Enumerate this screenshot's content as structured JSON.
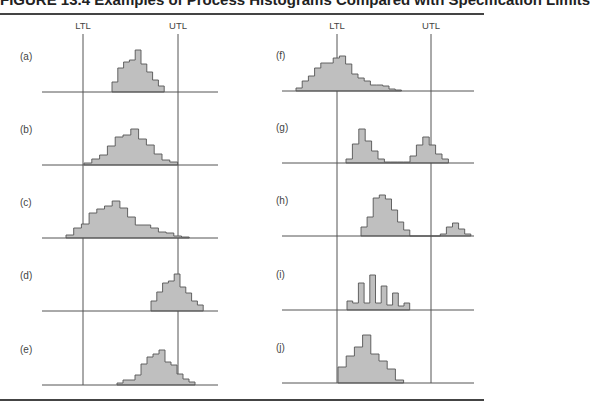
{
  "figure": {
    "title": "FIGURE 13.4 Examples of Process Histograms Compared with Specification Limits",
    "limits": {
      "lower": "LTL",
      "upper": "UTL"
    },
    "colors": {
      "fill": "#bfbfbf",
      "stroke": "#555555",
      "line": "#555555"
    }
  },
  "chart_data": {
    "type": "histogram-panels",
    "title": "FIGURE 13.4",
    "columns": [
      {
        "ltl_x": 83,
        "utl_x": 178,
        "panels": [
          {
            "label": "(a)",
            "baseline": 92,
            "x0": 112,
            "bw": 5.8,
            "heights": [
              10,
              24,
              30,
              32,
              42,
              28,
              20,
              12,
              6
            ],
            "description": "narrow, centered, well within limits"
          },
          {
            "label": "(b)",
            "baseline": 165,
            "x0": 84,
            "bw": 7.8,
            "heights": [
              2,
              6,
              10,
              19,
              28,
              30,
              36,
              26,
              20,
              11,
              5,
              3
            ],
            "description": "spread fills the tolerance exactly"
          },
          {
            "label": "(c)",
            "baseline": 238,
            "x0": 66,
            "bw": 7.7,
            "heights": [
              3,
              10,
              14,
              25,
              29,
              32,
              37,
              30,
              21,
              13,
              13,
              10,
              6,
              5,
              2,
              1
            ],
            "description": "wider than tolerance on both sides"
          },
          {
            "label": "(d)",
            "baseline": 311,
            "x0": 151,
            "bw": 5.8,
            "heights": [
              10,
              19,
              28,
              30,
              37,
              24,
              18,
              10,
              6
            ],
            "description": "shifted high, exceeds UTL"
          },
          {
            "label": "(e)",
            "baseline": 385,
            "x0": 117,
            "bw": 6.0,
            "heights": [
              2,
              5,
              5,
              10,
              21,
              28,
              31,
              35,
              23,
              20,
              11,
              6,
              3
            ],
            "description": "shifted high and skewed, exceeds UTL"
          }
        ]
      },
      {
        "ltl_x": 337,
        "utl_x": 431,
        "panels": [
          {
            "label": "(f)",
            "baseline": 91,
            "x0": 296,
            "bw": 6.2,
            "heights": [
              3,
              10,
              15,
              23,
              28,
              28,
              33,
              35,
              27,
              17,
              13,
              10,
              6,
              6,
              5,
              2,
              1
            ],
            "description": "shifted low and skewed, exceeds LTL"
          },
          {
            "label": "(g)",
            "baseline": 163,
            "x0": 346,
            "bw": 6.4,
            "heights": [
              4,
              19,
              34,
              22,
              12,
              4,
              1,
              1,
              1,
              1,
              7,
              18,
              26,
              18,
              9,
              4
            ],
            "description": "bimodal within limits"
          },
          {
            "label": "(h)",
            "baseline": 236,
            "x0": 361,
            "bw": 6.1,
            "heights": [
              9,
              19,
              38,
              41,
              37,
              26,
              14,
              6,
              0,
              0,
              0,
              0,
              0,
              2,
              9,
              13,
              7,
              2
            ],
            "description": "main group within limits plus small group beyond UTL"
          },
          {
            "label": "(i)",
            "baseline": 310,
            "x0": 347,
            "bw": 5.7,
            "heights": [
              9,
              7,
              27,
              7,
              35,
              7,
              24,
              5,
              17,
              4,
              7
            ],
            "description": "comb-shaped / saw-tooth"
          },
          {
            "label": "(j)",
            "baseline": 383,
            "x0": 338,
            "bw": 8.2,
            "heights": [
              16,
              27,
              36,
              48,
              29,
              22,
              14,
              3
            ],
            "description": "truncated at LTL"
          }
        ]
      }
    ],
    "xlabel": "",
    "ylabel": "",
    "annotations": [
      "LTL",
      "UTL"
    ]
  }
}
